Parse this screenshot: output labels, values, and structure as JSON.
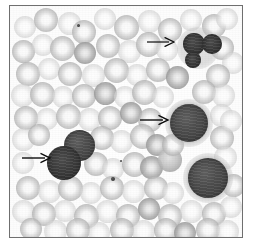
{
  "figure": {
    "kind": "light-microscopy-photomicrograph",
    "rendering": "grayscale",
    "border_color": "#6f6f6f",
    "background_color": "#fbfbfb",
    "frame": {
      "x": 9,
      "y": 5,
      "width": 234,
      "height": 233
    }
  },
  "palette": {
    "field_white": "#fbfbfb",
    "rbc_gray": "#b6b6b6",
    "rbc_pale_center": "#fafafa",
    "wbc_dark": "#454545",
    "wbc_darkest": "#343434",
    "arrow_black": "#0d0d0d",
    "platelet_gray": "#4a4a4a"
  },
  "arrows": [
    {
      "id": "arrow-top-right",
      "label": "arrow-pointing-to-lobed-dark-cell",
      "direction": "right",
      "x": 137,
      "y": 36,
      "length": 27,
      "thickness": 1.2,
      "color": "#0d0d0d",
      "points_to": "dark-cell-top-right"
    },
    {
      "id": "arrow-middle",
      "label": "arrow-pointing-to-large-dark-cell",
      "direction": "right",
      "x": 130,
      "y": 114,
      "length": 28,
      "thickness": 1.4,
      "color": "#0d0d0d",
      "points_to": "dark-cell-middle-right"
    },
    {
      "id": "arrow-left",
      "label": "arrow-pointing-to-dark-cell-pair",
      "direction": "right",
      "x": 12,
      "y": 152,
      "length": 28,
      "thickness": 1.4,
      "color": "#0d0d0d",
      "points_to": "dark-cell-pair-left"
    }
  ],
  "leukocytes": [
    {
      "id": "wbc-top-1",
      "x": 173,
      "y": 27,
      "d": 22,
      "tone": "darker",
      "halo": false
    },
    {
      "id": "wbc-top-2",
      "x": 192,
      "y": 28,
      "d": 20,
      "tone": "darker",
      "halo": false
    },
    {
      "id": "wbc-top-3",
      "x": 175,
      "y": 46,
      "d": 16,
      "tone": "darker",
      "halo": false
    },
    {
      "id": "wbc-middle-right",
      "x": 160,
      "y": 98,
      "d": 38,
      "tone": "normal",
      "halo": true
    },
    {
      "id": "wbc-left-upper",
      "x": 54,
      "y": 124,
      "d": 31,
      "tone": "normal",
      "halo": false
    },
    {
      "id": "wbc-left-lower",
      "x": 37,
      "y": 140,
      "d": 34,
      "tone": "darker",
      "halo": false
    },
    {
      "id": "wbc-bottom-right",
      "x": 178,
      "y": 152,
      "d": 40,
      "tone": "normal",
      "halo": true
    }
  ],
  "cytoplasm_rims": [
    {
      "id": "cytoplasm-top-right",
      "x": 167,
      "y": 21,
      "d": 42
    },
    {
      "id": "cytoplasm-middle-right",
      "x": 155,
      "y": 93,
      "d": 48
    },
    {
      "id": "cytoplasm-bottom-right",
      "x": 173,
      "y": 147,
      "d": 50
    }
  ],
  "platelets": [
    {
      "id": "platelet-upper-left",
      "x": 67,
      "y": 18,
      "d": 3.2
    },
    {
      "id": "platelet-center",
      "x": 101,
      "y": 171,
      "d": 4.2
    },
    {
      "id": "platelet-center-small",
      "x": 110,
      "y": 154,
      "d": 2.4
    }
  ],
  "erythrocytes": [
    {
      "x": 4,
      "y": 10,
      "d": 22,
      "v": "faint"
    },
    {
      "x": 24,
      "y": 2,
      "d": 24,
      "v": "normal"
    },
    {
      "x": 48,
      "y": 6,
      "d": 23,
      "v": "faint"
    },
    {
      "x": 62,
      "y": 14,
      "d": 24,
      "v": "normal"
    },
    {
      "x": 84,
      "y": 2,
      "d": 22,
      "v": "faint"
    },
    {
      "x": 104,
      "y": 9,
      "d": 25,
      "v": "normal"
    },
    {
      "x": 128,
      "y": 4,
      "d": 23,
      "v": "faint"
    },
    {
      "x": 148,
      "y": 12,
      "d": 24,
      "v": "normal"
    },
    {
      "x": 170,
      "y": 3,
      "d": 22,
      "v": "faint"
    },
    {
      "x": 192,
      "y": 8,
      "d": 24,
      "v": "normal"
    },
    {
      "x": 206,
      "y": 2,
      "d": 22,
      "v": "faint"
    },
    {
      "x": 2,
      "y": 34,
      "d": 23,
      "v": "normal"
    },
    {
      "x": 22,
      "y": 28,
      "d": 22,
      "v": "faint"
    },
    {
      "x": 40,
      "y": 30,
      "d": 25,
      "v": "normal"
    },
    {
      "x": 64,
      "y": 36,
      "d": 22,
      "v": "dense"
    },
    {
      "x": 86,
      "y": 28,
      "d": 24,
      "v": "normal"
    },
    {
      "x": 108,
      "y": 34,
      "d": 23,
      "v": "faint"
    },
    {
      "x": 126,
      "y": 26,
      "d": 25,
      "v": "normal"
    },
    {
      "x": 146,
      "y": 33,
      "d": 22,
      "v": "faint"
    },
    {
      "x": 200,
      "y": 30,
      "d": 24,
      "v": "normal"
    },
    {
      "x": 212,
      "y": 46,
      "d": 22,
      "v": "faint"
    },
    {
      "x": 6,
      "y": 56,
      "d": 24,
      "v": "normal"
    },
    {
      "x": 28,
      "y": 52,
      "d": 22,
      "v": "faint"
    },
    {
      "x": 48,
      "y": 56,
      "d": 24,
      "v": "normal"
    },
    {
      "x": 72,
      "y": 58,
      "d": 23,
      "v": "faint"
    },
    {
      "x": 94,
      "y": 52,
      "d": 25,
      "v": "normal"
    },
    {
      "x": 116,
      "y": 58,
      "d": 22,
      "v": "faint"
    },
    {
      "x": 136,
      "y": 52,
      "d": 24,
      "v": "normal"
    },
    {
      "x": 156,
      "y": 60,
      "d": 23,
      "v": "dense"
    },
    {
      "x": 196,
      "y": 58,
      "d": 24,
      "v": "normal"
    },
    {
      "x": 1,
      "y": 78,
      "d": 23,
      "v": "faint"
    },
    {
      "x": 20,
      "y": 76,
      "d": 25,
      "v": "normal"
    },
    {
      "x": 42,
      "y": 80,
      "d": 22,
      "v": "faint"
    },
    {
      "x": 62,
      "y": 78,
      "d": 24,
      "v": "normal"
    },
    {
      "x": 84,
      "y": 76,
      "d": 23,
      "v": "dense"
    },
    {
      "x": 104,
      "y": 80,
      "d": 22,
      "v": "faint"
    },
    {
      "x": 122,
      "y": 74,
      "d": 25,
      "v": "normal"
    },
    {
      "x": 142,
      "y": 80,
      "d": 22,
      "v": "faint"
    },
    {
      "x": 182,
      "y": 74,
      "d": 24,
      "v": "normal"
    },
    {
      "x": 202,
      "y": 78,
      "d": 23,
      "v": "faint"
    },
    {
      "x": 4,
      "y": 100,
      "d": 24,
      "v": "normal"
    },
    {
      "x": 26,
      "y": 102,
      "d": 22,
      "v": "faint"
    },
    {
      "x": 46,
      "y": 98,
      "d": 25,
      "v": "normal"
    },
    {
      "x": 68,
      "y": 102,
      "d": 23,
      "v": "faint"
    },
    {
      "x": 88,
      "y": 100,
      "d": 24,
      "v": "normal"
    },
    {
      "x": 110,
      "y": 96,
      "d": 22,
      "v": "dense"
    },
    {
      "x": 128,
      "y": 102,
      "d": 24,
      "v": "normal"
    },
    {
      "x": 200,
      "y": 98,
      "d": 23,
      "v": "faint"
    },
    {
      "x": 2,
      "y": 122,
      "d": 23,
      "v": "faint"
    },
    {
      "x": 18,
      "y": 118,
      "d": 22,
      "v": "normal"
    },
    {
      "x": 80,
      "y": 120,
      "d": 24,
      "v": "normal"
    },
    {
      "x": 100,
      "y": 124,
      "d": 23,
      "v": "faint"
    },
    {
      "x": 120,
      "y": 118,
      "d": 25,
      "v": "normal"
    },
    {
      "x": 136,
      "y": 128,
      "d": 22,
      "v": "dense"
    },
    {
      "x": 200,
      "y": 120,
      "d": 24,
      "v": "normal"
    },
    {
      "x": 210,
      "y": 104,
      "d": 22,
      "v": "faint"
    },
    {
      "x": 2,
      "y": 146,
      "d": 22,
      "v": "faint"
    },
    {
      "x": 74,
      "y": 146,
      "d": 24,
      "v": "normal"
    },
    {
      "x": 92,
      "y": 152,
      "d": 22,
      "v": "faint"
    },
    {
      "x": 112,
      "y": 146,
      "d": 25,
      "v": "normal"
    },
    {
      "x": 130,
      "y": 150,
      "d": 23,
      "v": "dense"
    },
    {
      "x": 148,
      "y": 142,
      "d": 24,
      "v": "solidish"
    },
    {
      "x": 152,
      "y": 128,
      "d": 22,
      "v": "normal"
    },
    {
      "x": 204,
      "y": 140,
      "d": 23,
      "v": "faint"
    },
    {
      "x": 6,
      "y": 170,
      "d": 24,
      "v": "normal"
    },
    {
      "x": 28,
      "y": 174,
      "d": 23,
      "v": "faint"
    },
    {
      "x": 48,
      "y": 170,
      "d": 25,
      "v": "normal"
    },
    {
      "x": 70,
      "y": 176,
      "d": 22,
      "v": "faint"
    },
    {
      "x": 90,
      "y": 170,
      "d": 24,
      "v": "normal"
    },
    {
      "x": 112,
      "y": 174,
      "d": 23,
      "v": "faint"
    },
    {
      "x": 134,
      "y": 170,
      "d": 24,
      "v": "normal"
    },
    {
      "x": 152,
      "y": 176,
      "d": 22,
      "v": "faint"
    },
    {
      "x": 212,
      "y": 168,
      "d": 23,
      "v": "normal"
    },
    {
      "x": 2,
      "y": 194,
      "d": 23,
      "v": "faint"
    },
    {
      "x": 22,
      "y": 196,
      "d": 24,
      "v": "normal"
    },
    {
      "x": 44,
      "y": 194,
      "d": 22,
      "v": "faint"
    },
    {
      "x": 64,
      "y": 198,
      "d": 25,
      "v": "normal"
    },
    {
      "x": 86,
      "y": 194,
      "d": 23,
      "v": "faint"
    },
    {
      "x": 106,
      "y": 198,
      "d": 24,
      "v": "normal"
    },
    {
      "x": 128,
      "y": 192,
      "d": 22,
      "v": "dense"
    },
    {
      "x": 148,
      "y": 198,
      "d": 24,
      "v": "normal"
    },
    {
      "x": 170,
      "y": 194,
      "d": 23,
      "v": "faint"
    },
    {
      "x": 192,
      "y": 196,
      "d": 24,
      "v": "normal"
    },
    {
      "x": 210,
      "y": 190,
      "d": 22,
      "v": "faint"
    },
    {
      "x": 10,
      "y": 212,
      "d": 22,
      "v": "normal"
    },
    {
      "x": 34,
      "y": 214,
      "d": 23,
      "v": "faint"
    },
    {
      "x": 56,
      "y": 212,
      "d": 24,
      "v": "normal"
    },
    {
      "x": 78,
      "y": 216,
      "d": 22,
      "v": "faint"
    },
    {
      "x": 100,
      "y": 212,
      "d": 24,
      "v": "normal"
    },
    {
      "x": 122,
      "y": 214,
      "d": 23,
      "v": "faint"
    },
    {
      "x": 144,
      "y": 212,
      "d": 24,
      "v": "normal"
    },
    {
      "x": 164,
      "y": 216,
      "d": 22,
      "v": "dense"
    },
    {
      "x": 186,
      "y": 212,
      "d": 24,
      "v": "normal"
    },
    {
      "x": 206,
      "y": 214,
      "d": 23,
      "v": "faint"
    }
  ]
}
